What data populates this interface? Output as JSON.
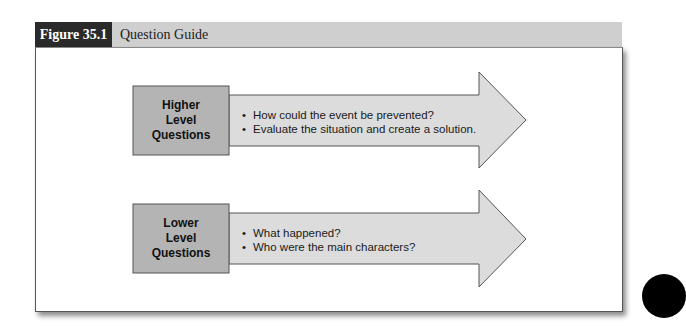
{
  "figure": {
    "label": "Figure 35.1",
    "title": "Question Guide"
  },
  "diagram": {
    "rows": [
      {
        "level_label_lines": [
          "Higher",
          "Level",
          "Questions"
        ],
        "bullets": [
          "How could the event be prevented?",
          "Evaluate the situation and create a solution."
        ]
      },
      {
        "level_label_lines": [
          "Lower",
          "Level",
          "Questions"
        ],
        "bullets": [
          "What happened?",
          "Who were the main characters?"
        ]
      }
    ]
  },
  "colors": {
    "header_label_bg": "#2a2a2a",
    "header_bar_bg": "#cfcfcf",
    "box_fill": "#b4b4b4",
    "arrow_fill": "#dcdcdc",
    "outline": "#555555"
  }
}
